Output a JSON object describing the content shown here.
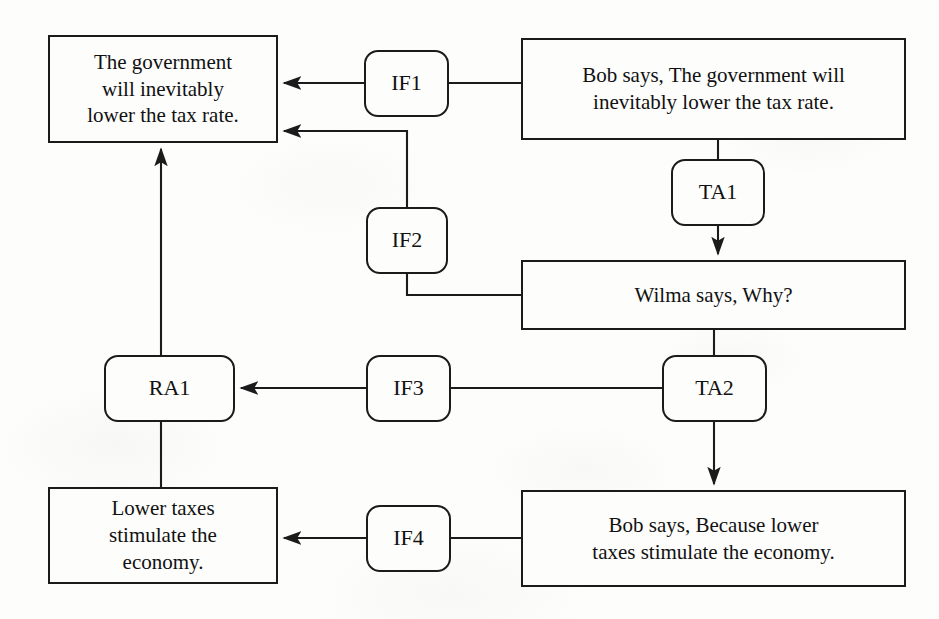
{
  "diagram": {
    "canvas": {
      "width": 939,
      "height": 619
    },
    "style": {
      "background_color": "#fdfdfc",
      "stroke_color": "#1b1b1b",
      "text_color": "#111111"
    },
    "nodes": [
      {
        "id": "I1",
        "kind": "proposition",
        "label": "The government\nwill inevitably\nlower the tax rate.",
        "x": 48,
        "y": 35,
        "w": 230,
        "h": 108
      },
      {
        "id": "L1",
        "kind": "locution",
        "label": "Bob says, The government will\ninevitably lower the tax rate.",
        "x": 521,
        "y": 38,
        "w": 385,
        "h": 102
      },
      {
        "id": "IF1",
        "kind": "relation",
        "label": "IF1",
        "x": 364,
        "y": 50,
        "w": 85,
        "h": 67
      },
      {
        "id": "TA1",
        "kind": "relation",
        "label": "TA1",
        "x": 671,
        "y": 159,
        "w": 94,
        "h": 67
      },
      {
        "id": "IF2",
        "kind": "relation",
        "label": "IF2",
        "x": 366,
        "y": 207,
        "w": 82,
        "h": 67
      },
      {
        "id": "L2",
        "kind": "locution",
        "label": "Wilma says, Why?",
        "x": 521,
        "y": 260,
        "w": 385,
        "h": 70
      },
      {
        "id": "RA1",
        "kind": "relation",
        "label": "RA1",
        "x": 104,
        "y": 355,
        "w": 131,
        "h": 67
      },
      {
        "id": "IF3",
        "kind": "relation",
        "label": "IF3",
        "x": 366,
        "y": 355,
        "w": 85,
        "h": 67
      },
      {
        "id": "TA2",
        "kind": "relation",
        "label": "TA2",
        "x": 662,
        "y": 355,
        "w": 105,
        "h": 67
      },
      {
        "id": "I2",
        "kind": "proposition",
        "label": "Lower taxes\nstimulate the\neconomy.",
        "x": 48,
        "y": 487,
        "w": 230,
        "h": 97
      },
      {
        "id": "IF4",
        "kind": "relation",
        "label": "IF4",
        "x": 366,
        "y": 505,
        "w": 85,
        "h": 67
      },
      {
        "id": "L3",
        "kind": "locution",
        "label": "Bob says, Because lower\ntaxes stimulate the economy.",
        "x": 521,
        "y": 490,
        "w": 385,
        "h": 97
      }
    ],
    "edges": [
      {
        "id": "e-L1-IF1",
        "from": "L1",
        "to": "IF1",
        "arrow": false,
        "path": "M 521 83 L 449 83"
      },
      {
        "id": "e-IF1-I1",
        "from": "IF1",
        "to": "I1",
        "arrow": true,
        "path": "M 364 83 L 284 83"
      },
      {
        "id": "e-L1-TA1",
        "from": "L1",
        "to": "TA1",
        "arrow": false,
        "path": "M 718 140 L 718 159"
      },
      {
        "id": "e-TA1-L2",
        "from": "TA1",
        "to": "L2",
        "arrow": true,
        "path": "M 718 226 L 718 254"
      },
      {
        "id": "e-L2-IF2",
        "from": "L2",
        "to": "IF2",
        "arrow": false,
        "path": "M 521 295 L 407 295 L 407 274"
      },
      {
        "id": "e-IF2-I1",
        "from": "IF2",
        "to": "I1",
        "arrow": true,
        "path": "M 407 207 L 407 131 L 284 131"
      },
      {
        "id": "e-L2-TA2",
        "from": "L2",
        "to": "TA2",
        "arrow": false,
        "path": "M 714 330 L 714 355"
      },
      {
        "id": "e-TA2-IF3",
        "from": "TA2",
        "to": "IF3",
        "arrow": false,
        "path": "M 662 388 L 451 388"
      },
      {
        "id": "e-IF3-RA1",
        "from": "IF3",
        "to": "RA1",
        "arrow": true,
        "path": "M 366 388 L 241 388"
      },
      {
        "id": "e-RA1-I1",
        "from": "RA1",
        "to": "I1",
        "arrow": true,
        "path": "M 161 355 L 161 149"
      },
      {
        "id": "e-I2-RA1",
        "from": "I2",
        "to": "RA1",
        "arrow": false,
        "path": "M 161 487 L 161 422"
      },
      {
        "id": "e-TA2-L3",
        "from": "TA2",
        "to": "L3",
        "arrow": true,
        "path": "M 714 422 L 714 484"
      },
      {
        "id": "e-L3-IF4",
        "from": "L3",
        "to": "IF4",
        "arrow": false,
        "path": "M 521 538 L 451 538"
      },
      {
        "id": "e-IF4-I2",
        "from": "IF4",
        "to": "I2",
        "arrow": true,
        "path": "M 366 538 L 284 538"
      }
    ]
  }
}
